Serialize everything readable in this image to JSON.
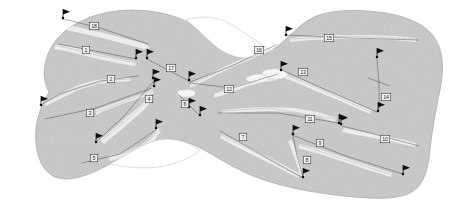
{
  "map": {
    "title": "Golf Course Layout Map",
    "kind": "golf-course-routing-plan",
    "colors": {
      "background": "#ffffff",
      "landmass": "#c9c9c9",
      "landmass_outline": "#a8a8a8",
      "fairway": "#ececec",
      "green": "#f5f5f5",
      "flag": "#0d0d0d",
      "hole_path": "#3a3a3a",
      "label_box_fill": "#f2f2f2",
      "label_box_stroke": "#2a2a2a",
      "label_text": "#1b1b1b"
    }
  },
  "holes": [
    {
      "number": "1",
      "label_x": 86,
      "label_y": 50,
      "tee_x": 137,
      "tee_y": 59,
      "green_x": 57,
      "green_y": 43
    },
    {
      "number": "2",
      "label_x": 111,
      "label_y": 79,
      "tee_x": 139,
      "tee_y": 76,
      "green_x": 41,
      "green_y": 105
    },
    {
      "number": "3",
      "label_x": 90,
      "label_y": 113,
      "tee_x": 44,
      "tee_y": 120,
      "green_x": 154,
      "green_y": 86
    },
    {
      "number": "4",
      "label_x": 149,
      "label_y": 99,
      "tee_x": 95,
      "tee_y": 143,
      "green_x": 155,
      "green_y": 79
    },
    {
      "number": "5",
      "label_x": 94,
      "label_y": 158,
      "tee_x": 82,
      "tee_y": 163,
      "green_x": 157,
      "green_y": 128
    },
    {
      "number": "6",
      "label_x": 185,
      "label_y": 104,
      "tee_x": 201,
      "tee_y": 118,
      "green_x": 172,
      "green_y": 91
    },
    {
      "number": "7",
      "label_x": 243,
      "label_y": 137,
      "tee_x": 305,
      "tee_y": 180,
      "green_x": 218,
      "green_y": 130
    },
    {
      "number": "8",
      "label_x": 307,
      "label_y": 160,
      "tee_x": 302,
      "tee_y": 178,
      "green_x": 294,
      "green_y": 136
    },
    {
      "number": "9",
      "label_x": 320,
      "label_y": 143,
      "tee_x": 404,
      "tee_y": 175,
      "green_x": 291,
      "green_y": 133
    },
    {
      "number": "10",
      "label_x": 385,
      "label_y": 139,
      "tee_x": 419,
      "tee_y": 146,
      "green_x": 340,
      "green_y": 124
    },
    {
      "number": "11",
      "label_x": 310,
      "label_y": 119,
      "tee_x": 218,
      "tee_y": 113,
      "green_x": 341,
      "green_y": 122
    },
    {
      "number": "12",
      "label_x": 229,
      "label_y": 89,
      "tee_x": 189,
      "tee_y": 82,
      "green_x": 281,
      "green_y": 71
    },
    {
      "number": "13",
      "label_x": 303,
      "label_y": 72,
      "tee_x": 281,
      "tee_y": 69,
      "green_x": 378,
      "green_y": 111
    },
    {
      "number": "14",
      "label_x": 386,
      "label_y": 97,
      "tee_x": 377,
      "tee_y": 57,
      "green_x": 379,
      "green_y": 110
    },
    {
      "number": "15",
      "label_x": 329,
      "label_y": 38,
      "tee_x": 286,
      "tee_y": 33,
      "green_x": 419,
      "green_y": 40
    },
    {
      "number": "16",
      "label_x": 259,
      "label_y": 50,
      "tee_x": 275,
      "tee_y": 44,
      "green_x": 188,
      "green_y": 82
    },
    {
      "number": "17",
      "label_x": 171,
      "label_y": 68,
      "tee_x": 146,
      "tee_y": 57,
      "green_x": 189,
      "green_y": 81
    },
    {
      "number": "18",
      "label_x": 94,
      "label_y": 26,
      "tee_x": 63,
      "tee_y": 18,
      "green_x": 150,
      "green_y": 47
    }
  ],
  "flags": [
    {
      "id": "flag-18-tee",
      "x": 63,
      "y": 18
    },
    {
      "id": "flag-1-tee",
      "x": 136,
      "y": 58
    },
    {
      "id": "flag-17-tee",
      "x": 147,
      "y": 58
    },
    {
      "id": "flag-17-mid",
      "x": 153,
      "y": 78
    },
    {
      "id": "flag-2-green",
      "x": 41,
      "y": 105
    },
    {
      "id": "flag-4-tee",
      "x": 96,
      "y": 142
    },
    {
      "id": "flag-5-mid",
      "x": 156,
      "y": 128
    },
    {
      "id": "flag-6-tee",
      "x": 200,
      "y": 115
    },
    {
      "id": "flag-12-tee",
      "x": 189,
      "y": 107
    },
    {
      "id": "flag-16-green",
      "x": 189,
      "y": 80
    },
    {
      "id": "flag-13-tee",
      "x": 281,
      "y": 70
    },
    {
      "id": "flag-15-tee",
      "x": 286,
      "y": 35
    },
    {
      "id": "flag-14-tee",
      "x": 377,
      "y": 57
    },
    {
      "id": "flag-14-green",
      "x": 378,
      "y": 111
    },
    {
      "id": "flag-11-mid",
      "x": 339,
      "y": 123
    },
    {
      "id": "flag-10-mid",
      "x": 341,
      "y": 124
    },
    {
      "id": "flag-9-tee",
      "x": 293,
      "y": 134
    },
    {
      "id": "flag-8-tee",
      "x": 303,
      "y": 177
    },
    {
      "id": "flag-9-green",
      "x": 403,
      "y": 174
    },
    {
      "id": "flag-3-green",
      "x": 154,
      "y": 86
    }
  ]
}
